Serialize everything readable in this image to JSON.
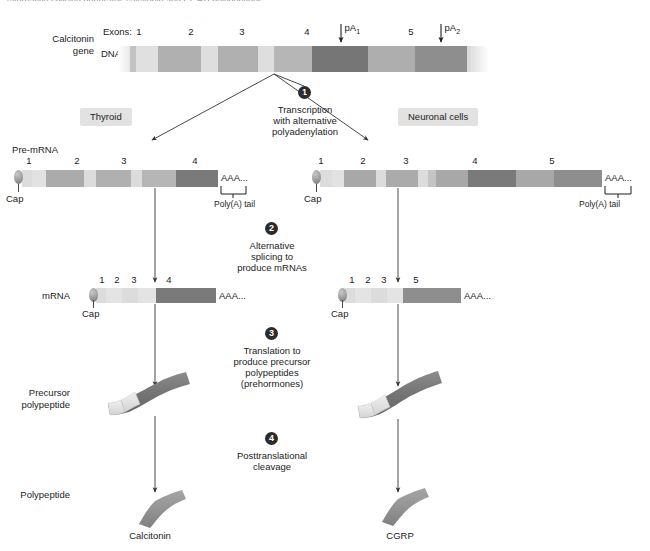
{
  "figure": {
    "top_cut_text": "Alternative splicing generates calcitonin and CGRP polypeptides",
    "row_labels": {
      "gene": "Calcitonin\ngene",
      "gene_line1": "Calcitonin",
      "gene_line2": "gene",
      "dna": "DNA",
      "pre_mrna": "Pre-mRNA",
      "mrna": "mRNA",
      "precursor_line1": "Precursor",
      "precursor_line2": "polypeptide",
      "polypeptide": "Polypeptide"
    },
    "gene": {
      "exons_label": "Exons:",
      "exon_numbers": [
        "1",
        "2",
        "3",
        "4",
        "5"
      ],
      "poly_a_sites": [
        "pA",
        "pA"
      ],
      "poly_a_subscripts": [
        "1",
        "2"
      ],
      "pa1_label": "pA",
      "pa1_sub": "1",
      "pa2_label": "pA",
      "pa2_sub": "2"
    },
    "tissues": {
      "left": "Thyroid",
      "right": "Neuronal cells"
    },
    "steps": [
      {
        "number": "1",
        "text_lines": [
          "Transcription",
          "with alternative",
          "polyadenylation"
        ]
      },
      {
        "number": "2",
        "text_lines": [
          "Alternative",
          "splicing to",
          "produce mRNAs"
        ]
      },
      {
        "number": "3",
        "text_lines": [
          "Translation to",
          "produce precursor",
          "polypeptides",
          "(prehormones)"
        ]
      },
      {
        "number": "4",
        "text_lines": [
          "Posttranslational",
          "cleavage"
        ]
      }
    ],
    "pre_mrna": {
      "left_exon_numbers": [
        "1",
        "2",
        "3",
        "4"
      ],
      "right_exon_numbers": [
        "1",
        "2",
        "3",
        "4",
        "5"
      ],
      "cap_label": "Cap",
      "aaa_label": "AAA...",
      "polyA_label": "Poly(A) tail"
    },
    "mrna": {
      "left_exon_numbers": [
        "1",
        "2",
        "3",
        "4"
      ],
      "right_exon_numbers": [
        "1",
        "2",
        "3",
        "5"
      ],
      "cap_label": "Cap",
      "aaa_label": "AAA..."
    },
    "products": {
      "left": "Calcitonin",
      "right": "CGRP"
    },
    "colors": {
      "exon_light": "#dcdcdc",
      "exon_mid": "#a9a9a9",
      "exon_dark": "#6f6f6f",
      "intron": "#bdbdbd",
      "background": "#ffffff",
      "text": "#1c1c1c",
      "pill_bg": "#e2e2e2",
      "step_circle": "#2b2b2b",
      "arrow": "#333333"
    }
  },
  "gene_segments": [
    {
      "name": "5-flank",
      "x": 0,
      "w": 12,
      "color": "#e8e8e8",
      "fade": "left"
    },
    {
      "name": "utr",
      "x": 12,
      "w": 6,
      "color": "#c2c2c2"
    },
    {
      "name": "exon1",
      "x": 18,
      "w": 22,
      "color": "#e0e0e0"
    },
    {
      "name": "intron1",
      "x": 40,
      "w": 43,
      "color": "#b0b0b0"
    },
    {
      "name": "exon2",
      "x": 83,
      "w": 17,
      "color": "#dedede"
    },
    {
      "name": "intron2",
      "x": 100,
      "w": 40,
      "color": "#b0b0b0"
    },
    {
      "name": "exon3",
      "x": 140,
      "w": 16,
      "color": "#dedede"
    },
    {
      "name": "intron3",
      "x": 156,
      "w": 38,
      "color": "#b6b6b6"
    },
    {
      "name": "exon4",
      "x": 194,
      "w": 56,
      "color": "#767676"
    },
    {
      "name": "intron4",
      "x": 250,
      "w": 47,
      "color": "#aeaeae"
    },
    {
      "name": "exon5",
      "x": 297,
      "w": 52,
      "color": "#8e8e8e"
    },
    {
      "name": "3-flank",
      "x": 349,
      "w": 22,
      "color": "#d8d8d8",
      "fade": "right"
    }
  ],
  "premrna_left_segments": [
    {
      "name": "cap-lead",
      "x": 0,
      "w": 10,
      "color": "#dcdcdc"
    },
    {
      "name": "exon1",
      "x": 10,
      "w": 14,
      "color": "#e2e2e2"
    },
    {
      "name": "intron1",
      "x": 24,
      "w": 38,
      "color": "#ababab"
    },
    {
      "name": "exon2",
      "x": 62,
      "w": 12,
      "color": "#dcdcdc"
    },
    {
      "name": "intron2",
      "x": 74,
      "w": 35,
      "color": "#b0b0b0"
    },
    {
      "name": "exon3",
      "x": 109,
      "w": 11,
      "color": "#dcdcdc"
    },
    {
      "name": "intron3",
      "x": 120,
      "w": 34,
      "color": "#b6b6b6"
    },
    {
      "name": "exon4",
      "x": 154,
      "w": 42,
      "color": "#7a7a7a"
    }
  ],
  "premrna_right_segments": [
    {
      "name": "cap-lead",
      "x": 0,
      "w": 12,
      "color": "#dcdcdc"
    },
    {
      "name": "exon1",
      "x": 12,
      "w": 12,
      "color": "#e2e2e2"
    },
    {
      "name": "intron1",
      "x": 24,
      "w": 32,
      "color": "#a8a8a8"
    },
    {
      "name": "exon2",
      "x": 56,
      "w": 10,
      "color": "#dcdcdc"
    },
    {
      "name": "intron2",
      "x": 66,
      "w": 32,
      "color": "#ababab"
    },
    {
      "name": "exon3",
      "x": 98,
      "w": 10,
      "color": "#dcdcdc"
    },
    {
      "name": "intron3",
      "x": 108,
      "w": 8,
      "color": "#c4c4c4"
    },
    {
      "name": "intron3b",
      "x": 116,
      "w": 32,
      "color": "#a8a8a8"
    },
    {
      "name": "exon4",
      "x": 148,
      "w": 48,
      "color": "#7a7a7a"
    },
    {
      "name": "intron4",
      "x": 196,
      "w": 38,
      "color": "#a8a8a8"
    },
    {
      "name": "exon5",
      "x": 234,
      "w": 48,
      "color": "#8e8e8e"
    }
  ],
  "mrna_left_segments": [
    {
      "name": "cap-lead",
      "x": 0,
      "w": 10,
      "color": "#dcdcdc"
    },
    {
      "name": "exon1",
      "x": 10,
      "w": 16,
      "color": "#e4e4e4"
    },
    {
      "name": "exon2",
      "x": 26,
      "w": 16,
      "color": "#dcdcdc"
    },
    {
      "name": "exon3",
      "x": 42,
      "w": 18,
      "color": "#e4e4e4"
    },
    {
      "name": "exon4",
      "x": 60,
      "w": 60,
      "color": "#7a7a7a"
    }
  ],
  "mrna_right_segments": [
    {
      "name": "cap-lead",
      "x": 0,
      "w": 10,
      "color": "#dcdcdc"
    },
    {
      "name": "exon1",
      "x": 10,
      "w": 16,
      "color": "#e4e4e4"
    },
    {
      "name": "exon2",
      "x": 26,
      "w": 16,
      "color": "#dcdcdc"
    },
    {
      "name": "exon3",
      "x": 42,
      "w": 16,
      "color": "#e4e4e4"
    },
    {
      "name": "exon5",
      "x": 58,
      "w": 58,
      "color": "#8e8e8e"
    }
  ]
}
